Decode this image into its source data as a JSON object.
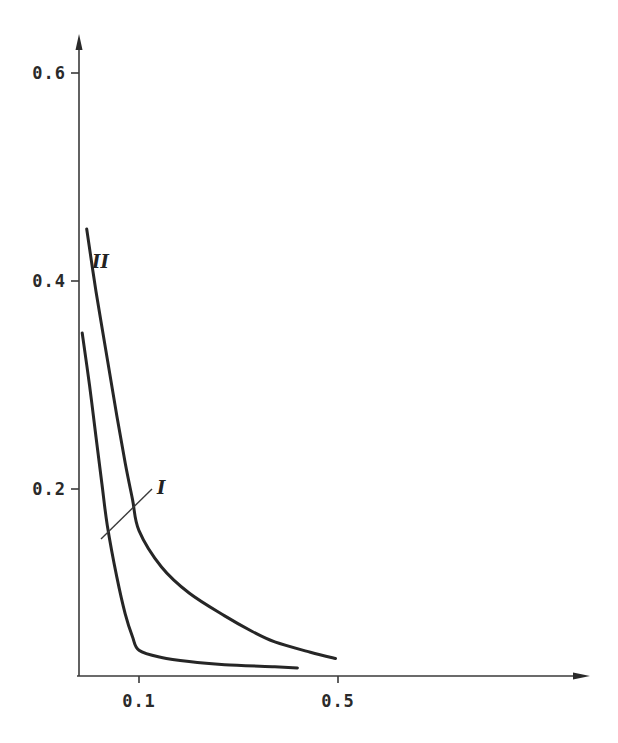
{
  "chart_data": {
    "type": "line",
    "title": "",
    "xlabel": "",
    "ylabel": "",
    "grid": false,
    "legend": "inline labels",
    "x_ticks": [
      {
        "value": 0.1,
        "label": "0.1"
      },
      {
        "value": 0.5,
        "label": "0.5"
      }
    ],
    "y_ticks": [
      {
        "value": 0.2,
        "label": "0.2"
      },
      {
        "value": 0.4,
        "label": "0.4"
      },
      {
        "value": 0.6,
        "label": "0.6"
      }
    ],
    "xlim": [
      0.038,
      1.3
    ],
    "ylim": [
      0.02,
      0.66
    ],
    "series": [
      {
        "name": "I",
        "label": "I",
        "points": [
          [
            0.04,
            0.35
          ],
          [
            0.045,
            0.3
          ],
          [
            0.05,
            0.25
          ],
          [
            0.055,
            0.205
          ],
          [
            0.06,
            0.165
          ],
          [
            0.07,
            0.115
          ],
          [
            0.08,
            0.08
          ],
          [
            0.09,
            0.058
          ],
          [
            0.1,
            0.045
          ],
          [
            0.12,
            0.038
          ],
          [
            0.15,
            0.034
          ],
          [
            0.2,
            0.031
          ],
          [
            0.3,
            0.029
          ],
          [
            0.36,
            0.028
          ]
        ]
      },
      {
        "name": "II",
        "label": "II",
        "points": [
          [
            0.043,
            0.45
          ],
          [
            0.05,
            0.39
          ],
          [
            0.06,
            0.325
          ],
          [
            0.07,
            0.27
          ],
          [
            0.08,
            0.225
          ],
          [
            0.09,
            0.19
          ],
          [
            0.1,
            0.16
          ],
          [
            0.12,
            0.125
          ],
          [
            0.15,
            0.1
          ],
          [
            0.2,
            0.078
          ],
          [
            0.25,
            0.063
          ],
          [
            0.3,
            0.053
          ],
          [
            0.4,
            0.043
          ],
          [
            0.49,
            0.037
          ]
        ]
      }
    ]
  }
}
